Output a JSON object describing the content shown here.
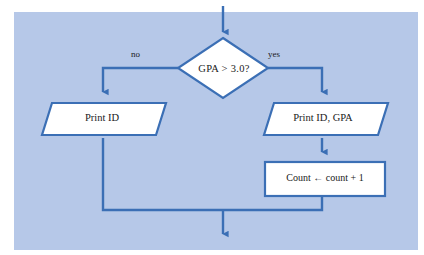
{
  "diagram": {
    "type": "flowchart",
    "panel_color": "#b6c8e8",
    "line_color": "#3b6fb5",
    "node_fill": "#ffffff",
    "text_color": "#1a1a1a",
    "nodes": [
      {
        "id": "decision",
        "shape": "diamond",
        "label": "GPA  >  3.0?"
      },
      {
        "id": "print-id",
        "shape": "parallelogram",
        "label": "Print ID"
      },
      {
        "id": "print-id-gpa",
        "shape": "parallelogram",
        "label": "Print ID, GPA"
      },
      {
        "id": "count-increment",
        "shape": "rectangle",
        "label": "Count ← count + 1"
      }
    ],
    "edge_labels": {
      "no": "no",
      "yes": "yes"
    }
  }
}
